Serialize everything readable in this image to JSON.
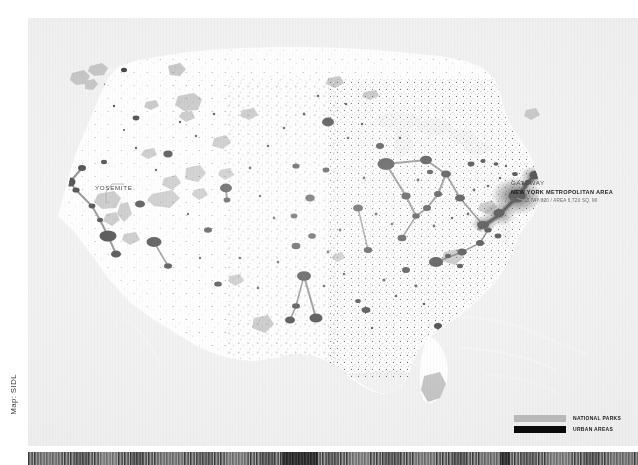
{
  "page": {
    "credit": "Map: SIDL"
  },
  "map": {
    "background_color": "#ececec",
    "land_color": "#fdfdfd",
    "urban_color": "#0a0a0a",
    "park_color": "#b4b4b4"
  },
  "annotations": [
    {
      "id": "gateway",
      "title": "GATEWAY",
      "subtitle": "NEW YORK METROPOLITAN AREA",
      "stats": "POP. 18,747,320 / AREA 6,720 SQ. MI"
    },
    {
      "id": "yosemite",
      "title": "YOSEMITE"
    }
  ],
  "legend": {
    "items": [
      {
        "label": "NATIONAL PARKS",
        "color": "#b9b9b9"
      },
      {
        "label": "URBAN AREAS",
        "color": "#0a0a0a"
      }
    ]
  }
}
